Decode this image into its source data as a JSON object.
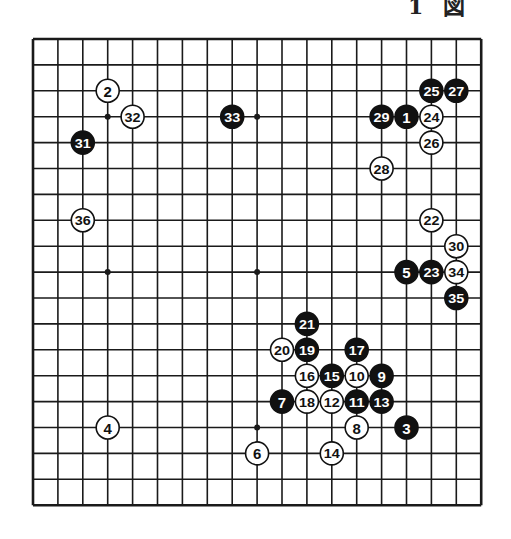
{
  "title": "1 図",
  "board": {
    "size": 19,
    "origin_x": 33,
    "origin_y": 39,
    "spacing_x": 24.9,
    "spacing_y": 25.9,
    "line_color": "#1a1a1a",
    "hoshi": [
      [
        3,
        3
      ],
      [
        9,
        3
      ],
      [
        15,
        3
      ],
      [
        3,
        9
      ],
      [
        9,
        9
      ],
      [
        15,
        9
      ],
      [
        3,
        15
      ],
      [
        9,
        15
      ],
      [
        15,
        15
      ]
    ]
  },
  "colors": {
    "black_stone": "#111111",
    "white_stone": "#ffffff",
    "stone_border": "#111111"
  },
  "stones": [
    {
      "n": 1,
      "color": "black",
      "col": 15,
      "row": 3
    },
    {
      "n": 2,
      "color": "white",
      "col": 3,
      "row": 2
    },
    {
      "n": 3,
      "color": "black",
      "col": 15,
      "row": 15
    },
    {
      "n": 4,
      "color": "white",
      "col": 3,
      "row": 15
    },
    {
      "n": 5,
      "color": "black",
      "col": 15,
      "row": 9
    },
    {
      "n": 6,
      "color": "white",
      "col": 9,
      "row": 16
    },
    {
      "n": 7,
      "color": "black",
      "col": 10,
      "row": 14
    },
    {
      "n": 8,
      "color": "white",
      "col": 13,
      "row": 15
    },
    {
      "n": 9,
      "color": "black",
      "col": 14,
      "row": 13
    },
    {
      "n": 10,
      "color": "white",
      "col": 13,
      "row": 13
    },
    {
      "n": 11,
      "color": "black",
      "col": 13,
      "row": 14
    },
    {
      "n": 12,
      "color": "white",
      "col": 12,
      "row": 14
    },
    {
      "n": 13,
      "color": "black",
      "col": 14,
      "row": 14
    },
    {
      "n": 14,
      "color": "white",
      "col": 12,
      "row": 16
    },
    {
      "n": 15,
      "color": "black",
      "col": 12,
      "row": 13
    },
    {
      "n": 16,
      "color": "white",
      "col": 11,
      "row": 13
    },
    {
      "n": 17,
      "color": "black",
      "col": 13,
      "row": 12
    },
    {
      "n": 18,
      "color": "white",
      "col": 11,
      "row": 14
    },
    {
      "n": 19,
      "color": "black",
      "col": 11,
      "row": 12
    },
    {
      "n": 20,
      "color": "white",
      "col": 10,
      "row": 12
    },
    {
      "n": 21,
      "color": "black",
      "col": 11,
      "row": 11
    },
    {
      "n": 22,
      "color": "white",
      "col": 16,
      "row": 7
    },
    {
      "n": 23,
      "color": "black",
      "col": 16,
      "row": 9
    },
    {
      "n": 24,
      "color": "white",
      "col": 16,
      "row": 3
    },
    {
      "n": 25,
      "color": "black",
      "col": 16,
      "row": 2
    },
    {
      "n": 26,
      "color": "white",
      "col": 16,
      "row": 4
    },
    {
      "n": 27,
      "color": "black",
      "col": 17,
      "row": 2
    },
    {
      "n": 28,
      "color": "white",
      "col": 14,
      "row": 5
    },
    {
      "n": 29,
      "color": "black",
      "col": 14,
      "row": 3
    },
    {
      "n": 30,
      "color": "white",
      "col": 17,
      "row": 8
    },
    {
      "n": 31,
      "color": "black",
      "col": 2,
      "row": 4
    },
    {
      "n": 32,
      "color": "white",
      "col": 4,
      "row": 3
    },
    {
      "n": 33,
      "color": "black",
      "col": 8,
      "row": 3
    },
    {
      "n": 34,
      "color": "white",
      "col": 17,
      "row": 9
    },
    {
      "n": 35,
      "color": "black",
      "col": 17,
      "row": 10
    },
    {
      "n": 36,
      "color": "white",
      "col": 2,
      "row": 7
    }
  ]
}
